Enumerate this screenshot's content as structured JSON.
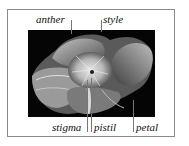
{
  "diagram": {
    "labels": {
      "anther": "anther",
      "style": "style",
      "stigma": "stigma",
      "pistil": "pistil",
      "petal": "petal"
    }
  }
}
